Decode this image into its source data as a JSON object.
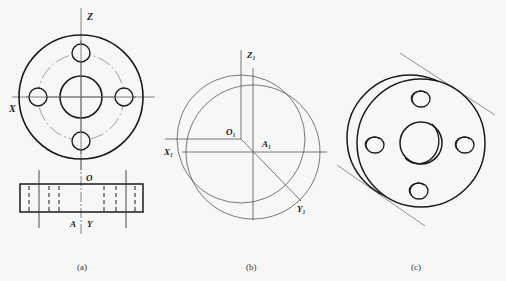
{
  "figures": {
    "a": {
      "caption": "(a)",
      "labels": {
        "z": "Z",
        "x": "X",
        "o": "O",
        "a": "A",
        "y": "Y"
      }
    },
    "b": {
      "caption": "(b)",
      "labels": {
        "z1": "Z₁",
        "o1": "O₁",
        "x1": "X₁",
        "a1": "A₁",
        "y1": "Y₁"
      }
    },
    "c": {
      "caption": "(c)"
    }
  },
  "colors": {
    "heavy_line": "#1a1a1a",
    "thin_line": "#666666",
    "background": "#f7f7f5"
  }
}
